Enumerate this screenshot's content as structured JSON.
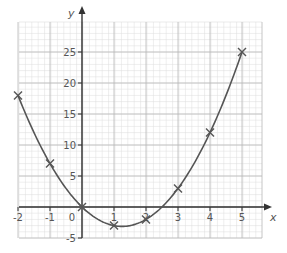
{
  "chart_data": {
    "type": "line",
    "title": "",
    "xlabel": "x",
    "ylabel": "y",
    "xlim": [
      -2,
      5.5
    ],
    "ylim": [
      -5,
      29
    ],
    "grid": true,
    "legend": null,
    "x_ticks": [
      -2,
      -1,
      0,
      1,
      2,
      3,
      4,
      5
    ],
    "x_tick_labels": [
      "-2",
      "-1",
      "0",
      "1",
      "2",
      "3",
      "4",
      "5"
    ],
    "y_ticks": [
      -5,
      5,
      10,
      15,
      20,
      25
    ],
    "y_tick_labels": [
      "-5",
      "5",
      "10",
      "15",
      "20",
      "25"
    ],
    "series": [
      {
        "name": "y = 2x² − 5x",
        "marker": "x",
        "curve": "smooth",
        "x": [
          -2,
          -1,
          0,
          1,
          2,
          3,
          4,
          5
        ],
        "y": [
          18,
          7,
          0,
          -3,
          -2,
          3,
          12,
          25
        ]
      }
    ],
    "colors": {
      "curve": "#555555",
      "axes": "#333333",
      "major_grid": "#b8b8b8",
      "minor_grid": "#dddddd"
    }
  }
}
